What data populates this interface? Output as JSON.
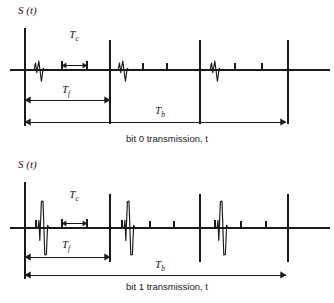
{
  "figure": {
    "title": "",
    "background": "#ffffff",
    "stroke": "#1a1a1a"
  },
  "panels": [
    {
      "id": "bit0",
      "axis_label": "S (t)",
      "caption": "bit 0 transmission, t",
      "dimensions": {
        "chip": "T",
        "chip_sub": "c",
        "frame": "T",
        "frame_sub": "f",
        "bit": "T",
        "bit_sub": "b"
      },
      "geometry": {
        "baseline_y": 70,
        "axis_x": 25,
        "axis_top_y": 28,
        "baseline_x_end": 330,
        "frame_boundaries": [
          110,
          200,
          288
        ],
        "frame_line_top_y": 40,
        "frame_line_bottom_y": 124,
        "tc_marker_left_x": 62,
        "tc_marker_right_x": 87,
        "tc_label_x": 74,
        "tc_label_y": 38,
        "tf_arrow_y": 100,
        "tf_arrow_x1": 25,
        "tf_arrow_x2": 110,
        "tf_label_x": 66,
        "tf_label_y": 93,
        "tb_arrow_y": 122,
        "tb_arrow_x1": 25,
        "tb_arrow_x2": 286,
        "tb_label_x": 160,
        "tb_label_y": 114,
        "caption_x": 167,
        "caption_y": 142,
        "axis_label_x": 18,
        "axis_label_y": 14
      },
      "pulses": [
        {
          "type": "monocycle",
          "x": 41,
          "amplitude": 9
        },
        {
          "type": "monocycle",
          "x": 125,
          "amplitude": 9
        },
        {
          "type": "tick",
          "x": 143,
          "amplitude": 7
        },
        {
          "type": "tick",
          "x": 167,
          "amplitude": 7
        },
        {
          "type": "monocycle",
          "x": 217,
          "amplitude": 9
        },
        {
          "type": "tick",
          "x": 235,
          "amplitude": 7
        },
        {
          "type": "tick",
          "x": 262,
          "amplitude": 7
        }
      ]
    },
    {
      "id": "bit1",
      "axis_label": "S (t)",
      "caption": "bit 1 transmission, t",
      "dimensions": {
        "chip": "T",
        "chip_sub": "c",
        "frame": "T",
        "frame_sub": "f",
        "bit": "T",
        "bit_sub": "b"
      },
      "geometry": {
        "baseline_y": 76,
        "axis_x": 25,
        "axis_top_y": 30,
        "baseline_x_end": 330,
        "frame_boundaries": [
          110,
          200,
          288
        ],
        "frame_line_top_y": 42,
        "frame_line_bottom_y": 110,
        "tc_marker_left_x": 62,
        "tc_marker_right_x": 87,
        "tc_label_x": 74,
        "tc_label_y": 46,
        "tf_arrow_y": 105,
        "tf_arrow_x1": 25,
        "tf_arrow_x2": 110,
        "tf_label_x": 66,
        "tf_label_y": 96,
        "tb_arrow_y": 123,
        "tb_arrow_x1": 25,
        "tb_arrow_x2": 286,
        "tb_label_x": 160,
        "tb_label_y": 116,
        "caption_x": 167,
        "caption_y": 138,
        "axis_label_x": 18,
        "axis_label_y": 16
      },
      "pulses": [
        {
          "type": "monocycle-large",
          "x": 45,
          "amplitude": 27,
          "pre_tick_x": 36,
          "pre_tick_amp": 8
        },
        {
          "type": "monocycle-large",
          "x": 131,
          "amplitude": 27,
          "pre_tick_x": 122,
          "pre_tick_amp": 8
        },
        {
          "type": "tick",
          "x": 150,
          "amplitude": 7
        },
        {
          "type": "tick",
          "x": 174,
          "amplitude": 7
        },
        {
          "type": "monocycle-large",
          "x": 224,
          "amplitude": 27,
          "pre_tick_x": 215,
          "pre_tick_amp": 8
        },
        {
          "type": "tick",
          "x": 241,
          "amplitude": 7
        },
        {
          "type": "tick",
          "x": 266,
          "amplitude": 7
        }
      ]
    }
  ]
}
